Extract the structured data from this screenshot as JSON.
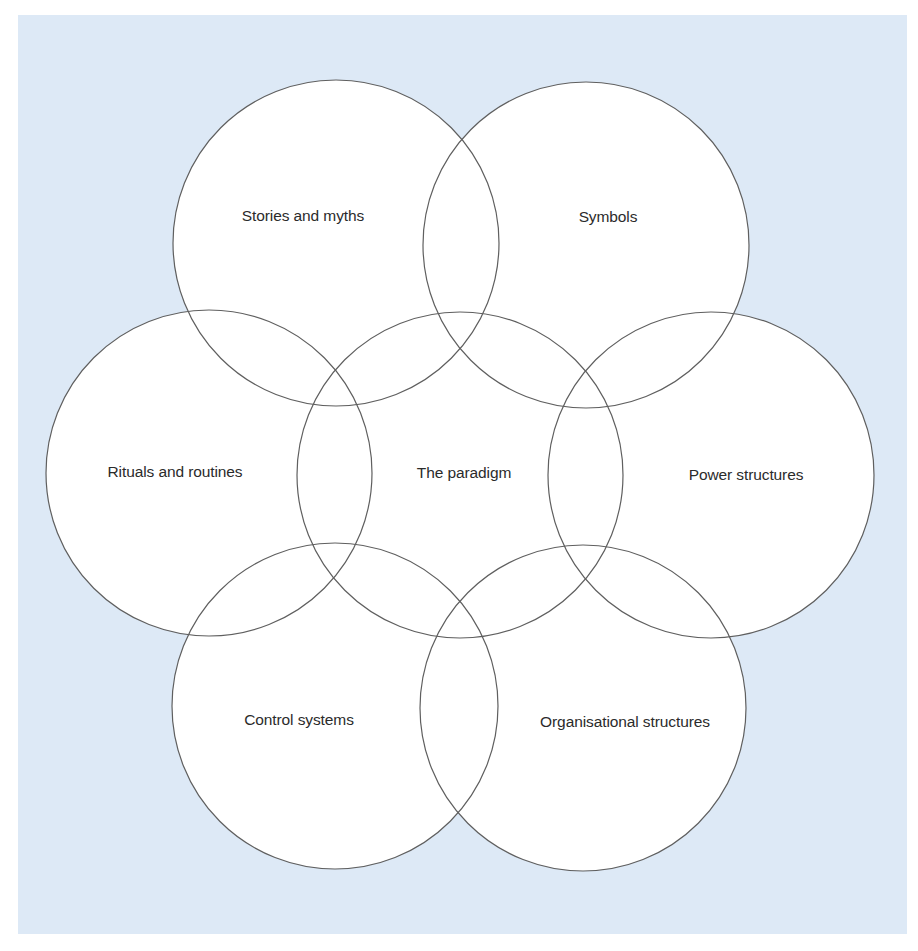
{
  "diagram": {
    "background_color": "#dde9f6",
    "circle_fill": "#ffffff",
    "circle_stroke": "#5f5f5f",
    "circles": [
      {
        "id": "stories",
        "label": "Stories and myths",
        "cx": 336,
        "cy": 243,
        "r": 163,
        "label_x": 303,
        "label_y": 216
      },
      {
        "id": "symbols",
        "label": "Symbols",
        "cx": 586,
        "cy": 245,
        "r": 163,
        "label_x": 608,
        "label_y": 217
      },
      {
        "id": "rituals",
        "label": "Rituals and routines",
        "cx": 209,
        "cy": 473,
        "r": 163,
        "label_x": 175,
        "label_y": 472
      },
      {
        "id": "paradigm",
        "label": "The paradigm",
        "cx": 460,
        "cy": 475,
        "r": 163,
        "label_x": 464,
        "label_y": 473
      },
      {
        "id": "power",
        "label": "Power structures",
        "cx": 711,
        "cy": 475,
        "r": 163,
        "label_x": 746,
        "label_y": 475
      },
      {
        "id": "control",
        "label": "Control systems",
        "cx": 335,
        "cy": 706,
        "r": 163,
        "label_x": 299,
        "label_y": 720
      },
      {
        "id": "organisational",
        "label": "Organisational structures",
        "cx": 583,
        "cy": 708,
        "r": 163,
        "label_x": 625,
        "label_y": 722
      }
    ]
  }
}
